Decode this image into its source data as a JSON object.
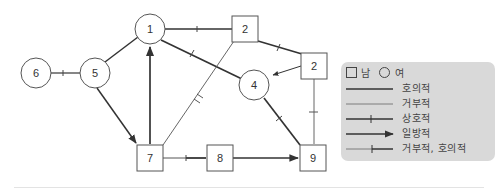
{
  "diagram": {
    "type": "sociogram",
    "nodes": [
      {
        "id": "n6",
        "label": "6",
        "shape": "circle",
        "gender": "female"
      },
      {
        "id": "n5",
        "label": "5",
        "shape": "circle",
        "gender": "female"
      },
      {
        "id": "n1",
        "label": "1",
        "shape": "circle",
        "gender": "female"
      },
      {
        "id": "n2a",
        "label": "2",
        "shape": "square",
        "gender": "male"
      },
      {
        "id": "n2b",
        "label": "2",
        "shape": "square",
        "gender": "male"
      },
      {
        "id": "n4",
        "label": "4",
        "shape": "circle",
        "gender": "female"
      },
      {
        "id": "n7",
        "label": "7",
        "shape": "square",
        "gender": "male"
      },
      {
        "id": "n8",
        "label": "8",
        "shape": "square",
        "gender": "male"
      },
      {
        "id": "n9",
        "label": "9",
        "shape": "square",
        "gender": "male"
      }
    ],
    "edges": [
      {
        "from": "n6",
        "to": "n5",
        "type": "mutual"
      },
      {
        "from": "n5",
        "to": "n1",
        "type": "favorable"
      },
      {
        "from": "n5",
        "to": "n7",
        "type": "one-way"
      },
      {
        "from": "n7",
        "to": "n1",
        "type": "one-way"
      },
      {
        "from": "n1",
        "to": "n2a",
        "type": "mutual"
      },
      {
        "from": "n1",
        "to": "n4",
        "type": "mutual"
      },
      {
        "from": "n2a",
        "to": "n2b",
        "type": "mutual"
      },
      {
        "from": "n2b",
        "to": "n4",
        "type": "one-way"
      },
      {
        "from": "n7",
        "to": "n2a",
        "type": "rejecting-favorable"
      },
      {
        "from": "n4",
        "to": "n9",
        "type": "mutual"
      },
      {
        "from": "n2b",
        "to": "n9",
        "type": "rejecting-favorable"
      },
      {
        "from": "n7",
        "to": "n8",
        "type": "mutual"
      },
      {
        "from": "n8",
        "to": "n9",
        "type": "one-way"
      }
    ]
  },
  "legend": {
    "male_label": "남",
    "female_label": "여",
    "items": [
      {
        "style": "favorable",
        "label": "호의적"
      },
      {
        "style": "rejecting",
        "label": "거부적"
      },
      {
        "style": "mutual",
        "label": "상호적"
      },
      {
        "style": "one-way",
        "label": "일방적"
      },
      {
        "style": "rejecting-favorable",
        "label": "거부적, 호의적"
      }
    ],
    "background": "#d9d9d9"
  },
  "colors": {
    "line": "#333333",
    "thin_line": "#555555",
    "node_border": "#555555"
  }
}
